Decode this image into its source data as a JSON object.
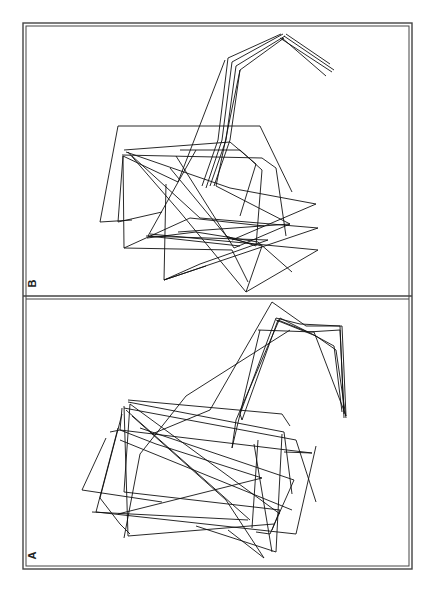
{
  "figure": {
    "panels": [
      {
        "label": "B",
        "frame": {
          "x": 23,
          "y": 23,
          "w": 389,
          "h": 274
        },
        "stroke": "#111111",
        "polylines": [
          "281,34 228,58 218,140 202,186",
          "283,34 232,62 222,140 206,188",
          "285,36 236,66 226,140 210,186",
          "284,38 240,70 230,140 214,186",
          "286,34 330,64",
          "284,36 334,70",
          "282,38 326,76",
          "280,38 332,72",
          "240,70 216,186 290,224",
          "225,60 178,182 123,156 118,222 162,212",
          "118,126 100,222 132,220",
          "118,126 260,126 292,192",
          "124,150 230,142 256,164 240,216",
          "122,155 262,158 276,168 286,236",
          "126,152 230,188 316,204 232,240",
          "123,156 124,248 190,218 264,226",
          "132,156 200,218 318,228 164,280",
          "128,152 180,212 246,292 318,250 150,234",
          "147,238 196,232 258,242 292,272",
          "146,236 268,240 200,264 164,280",
          "124,248 232,250 248,282",
          "166,184 164,280 206,266",
          "180,150 240,150 262,170 256,246 226,236",
          "196,150 148,236 240,246",
          "176,156 234,248 290,224 178,232",
          "170,168 228,238 262,246 246,292"
        ]
      },
      {
        "label": "A",
        "frame": {
          "x": 23,
          "y": 300,
          "w": 389,
          "h": 269
        },
        "stroke": "#111111",
        "polylines": [
          "272,302 306,326 342,326 346,416",
          "276,318 300,324 340,326 344,418",
          "278,320 308,332 340,330 344,414",
          "280,318 312,334 334,346 342,412",
          "276,320 316,336 336,350 346,418",
          "258,330 314,332 346,416",
          "272,302 210,410 152,434",
          "276,318 240,414 242,420",
          "278,320 242,420",
          "280,318 236,420 232,448",
          "260,330 232,448",
          "290,330 186,396 140,454 124,538",
          "128,400 282,414 290,426",
          "128,402 284,432 292,494",
          "122,408 120,430 312,453 284,452",
          "124,408 296,440 316,502",
          "110,432 120,430 156,444 262,478 118,514",
          "106,438 82,490 162,502",
          "122,414 100,498 120,524 130,534",
          "118,428 96,512 296,534 316,446",
          "130,404 124,492 280,510 272,530",
          "124,406 128,536 274,524",
          "126,410 250,520",
          "130,404 280,514",
          "140,428 294,480 270,534 256,532",
          "132,416 226,500 264,558 228,530",
          "92,512 248,520",
          "258,440 252,528",
          "282,434 276,552 196,526",
          "254,444 272,552",
          "120,440 292,510"
        ]
      }
    ]
  }
}
